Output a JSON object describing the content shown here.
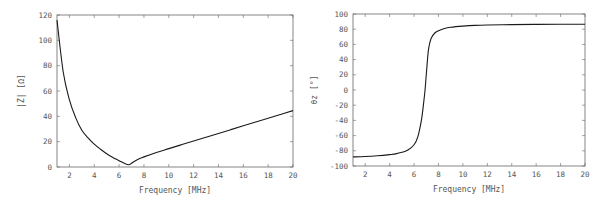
{
  "chart_data": [
    {
      "type": "line",
      "title": "",
      "xlabel": "Frequency   [MHz]",
      "ylabel": "|Z|  [Ω]",
      "xlim": [
        1,
        20
      ],
      "ylim": [
        0,
        120
      ],
      "xticks": [
        2,
        4,
        6,
        8,
        10,
        12,
        14,
        16,
        18,
        20
      ],
      "yticks": [
        0,
        20,
        40,
        60,
        80,
        100,
        120
      ],
      "grid": false,
      "legend": null,
      "series": [
        {
          "name": "|Z|",
          "x": [
            1,
            1.5,
            2,
            2.5,
            3,
            3.5,
            4,
            4.5,
            5,
            5.5,
            6,
            6.5,
            6.8,
            7,
            7.5,
            8,
            9,
            10,
            11,
            12,
            13,
            14,
            15,
            16,
            17,
            18,
            19,
            20
          ],
          "values": [
            116,
            75,
            53,
            39,
            29,
            23,
            18,
            14,
            10.5,
            7.5,
            5,
            2.5,
            1.8,
            3,
            6,
            8,
            11.5,
            14.5,
            17.5,
            20.5,
            23.5,
            26.5,
            29.5,
            32.5,
            35.5,
            38.5,
            41.5,
            44.5
          ]
        }
      ]
    },
    {
      "type": "line",
      "title": "",
      "xlabel": "Frequency   [MHz]",
      "ylabel": "θz  [°]",
      "xlim": [
        1,
        20
      ],
      "ylim": [
        -100,
        100
      ],
      "xticks": [
        2,
        4,
        6,
        8,
        10,
        12,
        14,
        16,
        18,
        20
      ],
      "yticks": [
        -100,
        -80,
        -60,
        -40,
        -20,
        0,
        20,
        40,
        60,
        80,
        100
      ],
      "grid": false,
      "legend": null,
      "series": [
        {
          "name": "θz",
          "x": [
            1,
            2,
            3,
            4,
            4.5,
            5,
            5.5,
            6,
            6.3,
            6.6,
            6.8,
            6.9,
            7,
            7.1,
            7.2,
            7.4,
            7.7,
            8,
            8.5,
            9,
            10,
            11,
            12,
            14,
            16,
            18,
            20
          ],
          "values": [
            -88,
            -87.5,
            -86.5,
            -85,
            -84,
            -82,
            -79,
            -72,
            -62,
            -40,
            -15,
            0,
            20,
            40,
            55,
            68,
            75,
            78,
            81,
            82.5,
            84,
            85,
            85.5,
            86,
            86.3,
            86.5,
            86.6
          ]
        }
      ]
    }
  ],
  "plots": {
    "left": {
      "xlabel": "Frequency   [MHz]",
      "ylabel": "|Z|  [Ω]",
      "xtick_labels": [
        "2",
        "4",
        "6",
        "8",
        "10",
        "12",
        "14",
        "16",
        "18",
        "20"
      ],
      "ytick_labels": [
        "0",
        "20",
        "40",
        "60",
        "80",
        "100",
        "120"
      ]
    },
    "right": {
      "xlabel": "Frequency   [MHz]",
      "ylabel": "θz  [°]",
      "xtick_labels": [
        "2",
        "4",
        "6",
        "8",
        "10",
        "12",
        "14",
        "16",
        "18",
        "20"
      ],
      "ytick_labels": [
        "100",
        "80",
        "60",
        "40",
        "20",
        "0",
        "-20",
        "-40",
        "-60",
        "-80",
        "-100"
      ]
    }
  },
  "colors": {
    "line": "#1a1a1a",
    "axes": "#666666",
    "text": "#555555"
  }
}
